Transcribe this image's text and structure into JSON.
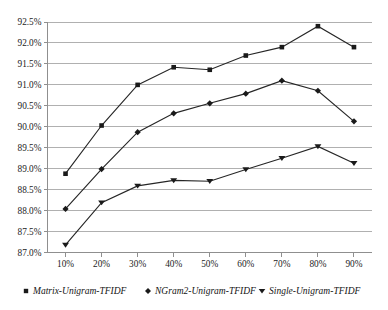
{
  "chart_data": {
    "type": "line",
    "title": "",
    "subtitle": "",
    "xlabel": "",
    "ylabel": "",
    "categories": [
      "10%",
      "20%",
      "30%",
      "40%",
      "50%",
      "60%",
      "70%",
      "80%",
      "90%"
    ],
    "x_tick_labels": [
      "10%",
      "20%",
      "30%",
      "40%",
      "50%",
      "60%",
      "70%",
      "80%",
      "90%"
    ],
    "y_tick_labels": [
      "87.0%",
      "87.5%",
      "88.0%",
      "88.5%",
      "89.0%",
      "89.5%",
      "90.0%",
      "90.5%",
      "91.0%",
      "91.5%",
      "92.0%",
      "92.5%"
    ],
    "y_tick_values": [
      87.0,
      87.5,
      88.0,
      88.5,
      89.0,
      89.5,
      90.0,
      90.5,
      91.0,
      91.5,
      92.0,
      92.5
    ],
    "ylim": [
      87.0,
      92.5
    ],
    "grid": true,
    "grid_axis": "y",
    "legend_position": "bottom",
    "series": [
      {
        "name": "Matrix-Unigram-TFIDF",
        "marker": "square",
        "color": "#1a1a1a",
        "values": [
          88.88,
          90.03,
          91.0,
          91.42,
          91.36,
          91.7,
          91.9,
          92.4,
          91.9
        ]
      },
      {
        "name": "NGram2-Unigram-TFIDF",
        "marker": "diamond",
        "color": "#1a1a1a",
        "values": [
          88.04,
          88.99,
          89.87,
          90.32,
          90.56,
          90.79,
          91.1,
          90.86,
          90.13
        ]
      },
      {
        "name": "Single-Unigram-TFIDF",
        "marker": "triangle-down",
        "color": "#1a1a1a",
        "values": [
          87.18,
          88.19,
          88.59,
          88.72,
          88.7,
          88.98,
          89.25,
          89.53,
          89.13
        ]
      }
    ]
  },
  "legend": {
    "items": [
      {
        "label": "Matrix-Unigram-TFIDF",
        "marker": "square"
      },
      {
        "label": "NGram2-Unigram-TFIDF",
        "marker": "diamond"
      },
      {
        "label": "Single-Unigram-TFIDF",
        "marker": "triangle-down"
      }
    ]
  },
  "colors": {
    "series": "#1a1a1a",
    "gridline": "#b0b0b0",
    "axis": "#8f8f8f",
    "background": "#ffffff"
  }
}
